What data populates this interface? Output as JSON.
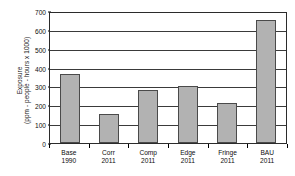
{
  "chart_data": {
    "type": "bar",
    "title": "",
    "xlabel": "",
    "ylabel_line1": "Exposure",
    "ylabel_line2": "(ppm - people - hours x 1000)",
    "ylabel": "Exposure (ppm - people - hours x 1000)",
    "categories": [
      "Base 1990",
      "Corr 2011",
      "Comp 2011",
      "Edge 2011",
      "Fringe 2011",
      "BAU 2011"
    ],
    "category_lines": [
      {
        "name": "Base",
        "year": "1990"
      },
      {
        "name": "Corr",
        "year": "2011"
      },
      {
        "name": "Comp",
        "year": "2011"
      },
      {
        "name": "Edge",
        "year": "2011"
      },
      {
        "name": "Fringe",
        "year": "2011"
      },
      {
        "name": "BAU",
        "year": "2011"
      }
    ],
    "values": [
      365,
      152,
      283,
      300,
      212,
      650
    ],
    "ylim": [
      0,
      700
    ],
    "ytick_values": [
      0,
      100,
      200,
      300,
      400,
      500,
      600,
      700
    ],
    "ytick_labels": [
      "0",
      "100",
      "200",
      "300",
      "400",
      "500",
      "600",
      "700"
    ],
    "grid": true,
    "legend": "none",
    "bar_color": "#b2b2b2",
    "bar_border_color": "#4a4a4a",
    "axis_color": "#2b2b2b",
    "grid_color": "#3a3a3a",
    "background_color": "#ffffff"
  }
}
